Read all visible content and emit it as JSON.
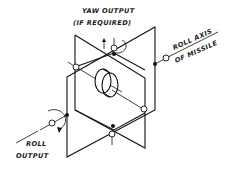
{
  "figure": {
    "type": "gimbal-schematic",
    "labels": {
      "yaw_line1": "YAW OUTPUT",
      "yaw_line2": "(IF REQUIRED)",
      "roll_axis_line1": "ROLL AXIS",
      "roll_axis_line2": "OF MISSILE",
      "roll_output_line1": "ROLL",
      "roll_output_line2": "OUTPUT"
    },
    "components": [
      "outer-gimbal-frame",
      "inner-gimbal-frame",
      "rotor",
      "pivot-bearings",
      "yaw-output-arrow",
      "roll-output-arrow",
      "roll-axis-line"
    ],
    "colors": {
      "ink": "#111111",
      "background": "#ffffff"
    }
  }
}
